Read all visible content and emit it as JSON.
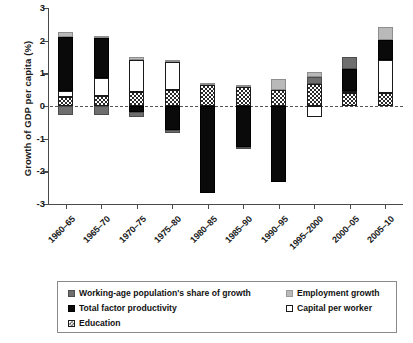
{
  "chart_data": {
    "type": "bar",
    "subtype": "stacked-diverging",
    "title": "",
    "xlabel": "",
    "ylabel": "Growth of GDP per capita (%)",
    "ylim": [
      -3,
      3
    ],
    "ytick_labels": [
      "3",
      "2",
      "1",
      "0",
      "-1",
      "-2",
      "-3"
    ],
    "ytick_values": [
      3,
      2,
      1,
      0,
      -1,
      -2,
      -3
    ],
    "grid": false,
    "zero_line": true,
    "legend_position": "bottom",
    "categories": [
      "1960–65",
      "1965–70",
      "1970–75",
      "1975–80",
      "1980–85",
      "1985–90",
      "1990–95",
      "1995–2000",
      "2000–05",
      "2005–10"
    ],
    "series": [
      {
        "name": "Education",
        "key": "education",
        "color": "#ffffff",
        "pattern": "checkered",
        "values": [
          0.28,
          0.32,
          0.43,
          0.49,
          0.63,
          0.59,
          0.48,
          0.66,
          0.41,
          0.4
        ]
      },
      {
        "name": "Capital per worker",
        "key": "capital_per_worker",
        "color": "#ffffff",
        "values": [
          0.17,
          0.53,
          0.99,
          0.86,
          0.0,
          0.0,
          0.0,
          -0.33,
          0.06,
          1.02
        ]
      },
      {
        "name": "Total factor productivity",
        "key": "total_factor_productivity",
        "color": "#0a0a0a",
        "values": [
          1.66,
          1.23,
          -0.19,
          -0.74,
          -2.66,
          -1.25,
          -2.33,
          0.0,
          0.66,
          0.61
        ]
      },
      {
        "name": "Working-age population's share of growth",
        "key": "working_age_population_share",
        "color": "#6e6e6e",
        "values": [
          -0.29,
          -0.28,
          -0.16,
          -0.1,
          0.0,
          -0.06,
          0.0,
          0.24,
          0.38,
          0.0
        ]
      },
      {
        "name": "Employment growth",
        "key": "employment_growth",
        "color": "#b9b9b9",
        "values": [
          0.15,
          0.07,
          0.08,
          0.06,
          0.07,
          0.05,
          0.36,
          0.13,
          0.0,
          0.38
        ]
      }
    ],
    "positive_totals": [
      2.26,
      2.15,
      1.5,
      1.41,
      1.04,
      0.78,
      0.84,
      1.03,
      1.51,
      2.41
    ],
    "negative_totals": [
      -0.29,
      -0.28,
      -0.35,
      -0.84,
      -2.03,
      -0.72,
      -2.33,
      -0.33,
      0.0,
      0.0
    ]
  },
  "legend": {
    "items": [
      {
        "label": "Working-age population's share of growth",
        "swatch": "wap"
      },
      {
        "label": "Employment growth",
        "swatch": "emp"
      },
      {
        "label": "Total factor productivity",
        "swatch": "tfp"
      },
      {
        "label": "Capital per worker",
        "swatch": "cap"
      },
      {
        "label": "Education",
        "swatch": "edu"
      }
    ]
  }
}
